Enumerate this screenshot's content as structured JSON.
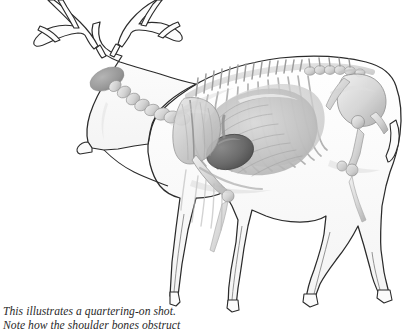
{
  "figure": {
    "view": "quartering-on, left side, antlered buck facing lower-left",
    "style": "grayscale pencil / airbrush anatomical illustration on white background"
  },
  "caption": {
    "line1": "This illustrates a quartering-on shot.",
    "line2": "Note how the shoulder bones obstruct"
  },
  "colors": {
    "background": "#ffffff",
    "outline": "#2b2b2b",
    "body_fill": "#fbfbfb",
    "body_shade": "#f2f2f2",
    "bone_light": "#e8e8e8",
    "bone_mid": "#c9c9c9",
    "bone_dark": "#9a9a9a",
    "organ_lung": "#cfcfcf",
    "organ_lung_dark": "#a8a8a8",
    "organ_heart": "#6f6f6f",
    "organ_heart_dark": "#555555",
    "ear_gray": "#9b9b9b",
    "caption_text": "#2a2a2a"
  },
  "anatomy_parts": [
    {
      "name": "antlers",
      "label": "Antlers",
      "note": "multi-tined, cropped by top edge"
    },
    {
      "name": "ear",
      "label": "Ear",
      "note": "shaded gray oval on head"
    },
    {
      "name": "skull-head",
      "label": "Head / skull",
      "note": "facing lower-left"
    },
    {
      "name": "cervical-vertebrae",
      "label": "Cervical vertebrae",
      "note": "chain of neck bones"
    },
    {
      "name": "thoracic-spine",
      "label": "Thoracic spine",
      "note": "dorsal spinous processes along the back"
    },
    {
      "name": "scapula",
      "label": "Scapula / shoulder blade",
      "note": "overlaps the vital area"
    },
    {
      "name": "humerus",
      "label": "Humerus / shoulder bone",
      "note": "front leg upper bone"
    },
    {
      "name": "ribcage",
      "label": "Ribcage",
      "note": "curved rib arcs over the chest cavity"
    },
    {
      "name": "lungs",
      "label": "Lungs",
      "note": "large pale gray mass filling chest"
    },
    {
      "name": "heart",
      "label": "Heart",
      "note": "dark gray oval low in the chest behind the shoulder"
    },
    {
      "name": "pelvis",
      "label": "Pelvis",
      "note": "hindquarter bone structure"
    },
    {
      "name": "femur",
      "label": "Femur",
      "note": "hind leg upper bone"
    },
    {
      "name": "front-legs",
      "label": "Front legs",
      "note": "two legs, near leg forward"
    },
    {
      "name": "hind-legs",
      "label": "Hind legs",
      "note": "two legs with hooves"
    },
    {
      "name": "tail",
      "label": "Tail",
      "note": "short, at rump"
    }
  ]
}
